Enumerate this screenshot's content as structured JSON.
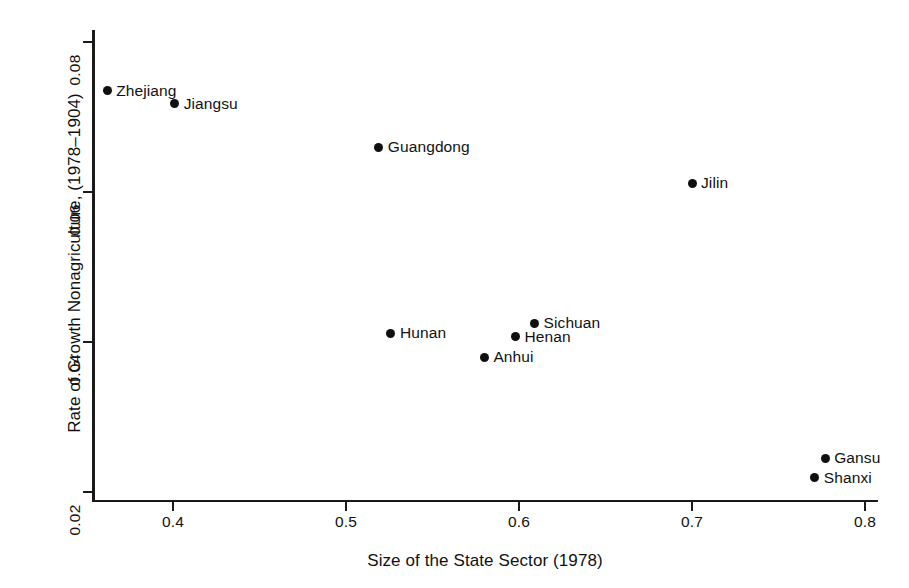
{
  "chart_data": {
    "type": "scatter",
    "title": "",
    "xlabel": "Size of the State Sector (1978)",
    "ylabel": "Rate of Growth Nonagriculture, (1978–1904)",
    "xlim": [
      0.345,
      0.808
    ],
    "ylim": [
      0.0185,
      0.0813
    ],
    "xticks": [
      "0.4",
      "0.5",
      "0.6",
      "0.7",
      "0.8"
    ],
    "xtick_values": [
      0.4,
      0.5,
      0.6,
      0.7,
      0.8
    ],
    "yticks": [
      "0.02",
      "0.04",
      "0.06",
      "0.08"
    ],
    "ytick_values": [
      0.02,
      0.04,
      0.06,
      0.08
    ],
    "grid": false,
    "legend": "none",
    "marker_color": "#101010",
    "axis_color": "#1a1a1a",
    "points": [
      {
        "label": "Zhejiang",
        "x": 0.362,
        "y": 0.0735,
        "label_side": "right"
      },
      {
        "label": "Jiangsu",
        "x": 0.401,
        "y": 0.0718,
        "label_side": "right"
      },
      {
        "label": "Guangdong",
        "x": 0.519,
        "y": 0.066,
        "label_side": "right"
      },
      {
        "label": "Jilin",
        "x": 0.7,
        "y": 0.0612,
        "label_side": "right"
      },
      {
        "label": "Sichuan",
        "x": 0.609,
        "y": 0.0425,
        "label_side": "right"
      },
      {
        "label": "Hunan",
        "x": 0.526,
        "y": 0.0412,
        "label_side": "right"
      },
      {
        "label": "Henan",
        "x": 0.598,
        "y": 0.0407,
        "label_side": "right"
      },
      {
        "label": "Anhui",
        "x": 0.58,
        "y": 0.038,
        "label_side": "right"
      },
      {
        "label": "Gansu",
        "x": 0.777,
        "y": 0.0245,
        "label_side": "right"
      },
      {
        "label": "Shanxi",
        "x": 0.771,
        "y": 0.0219,
        "label_side": "right"
      }
    ]
  }
}
